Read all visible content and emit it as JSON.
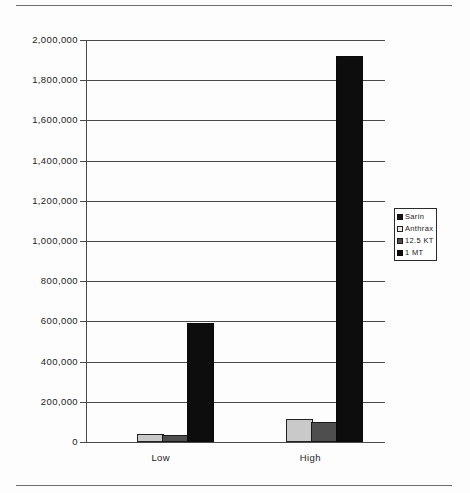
{
  "chart_data": {
    "type": "bar",
    "title": "",
    "subtitle": "",
    "xlabel": "",
    "ylabel": "",
    "categories": [
      "Low",
      "High"
    ],
    "series": [
      {
        "name": "Sarin",
        "color": "#151515",
        "values": [
          0,
          0
        ]
      },
      {
        "name": "Anthrax",
        "color": "#c9c9c9",
        "values": [
          30000,
          105000
        ]
      },
      {
        "name": "12.5 KT",
        "color": "#4e4e4e",
        "values": [
          25000,
          90000
        ]
      },
      {
        "name": "1 MT",
        "color": "#0d0d0d",
        "values": [
          580000,
          1910000
        ]
      }
    ],
    "ylim": [
      0,
      2000000
    ],
    "ytick_values": [
      0,
      200000,
      400000,
      600000,
      800000,
      1000000,
      1200000,
      1400000,
      1600000,
      1800000,
      2000000
    ],
    "ytick_labels": [
      "0",
      "200,000",
      "400,000",
      "600,000",
      "800,000",
      "1,000,000",
      "1,200,000",
      "1,400,000",
      "1,600,000",
      "1,800,000",
      "2,000,000"
    ],
    "grid": true,
    "legend_position": "right"
  },
  "legend": {
    "items": [
      {
        "label": "Sarin",
        "swatch": "legend-swatch-sarin"
      },
      {
        "label": "Anthrax",
        "swatch": "legend-swatch-anthrax"
      },
      {
        "label": "12.5 KT",
        "swatch": "legend-swatch-125kt"
      },
      {
        "label": "1 MT",
        "swatch": "legend-swatch-1mt"
      }
    ]
  },
  "colors": {
    "axis": "#4a4a4a",
    "frame": "#6d6d6d",
    "text": "#1c1c1c",
    "background": "#fdfdfd"
  }
}
